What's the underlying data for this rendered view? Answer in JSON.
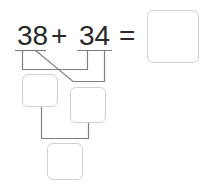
{
  "equation": {
    "operand_a": "38",
    "operator": "+",
    "operand_b": "34",
    "equals": "=",
    "answer": ""
  },
  "decomposition": {
    "tens_sum_box": "",
    "ones_sum_box": "",
    "total_box": ""
  },
  "colors": {
    "text": "#2a2a2a",
    "line": "#808080",
    "box_border": "#cfcfcf"
  }
}
